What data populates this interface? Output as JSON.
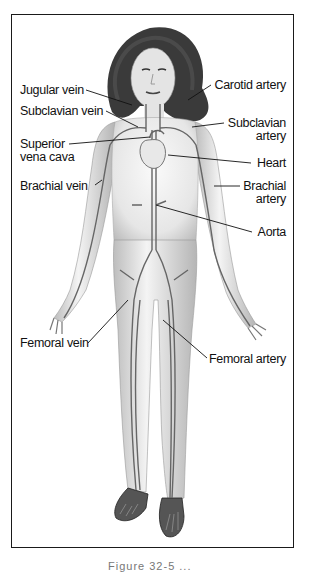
{
  "figure": {
    "labels": {
      "jugular_vein": "Jugular vein",
      "subclavian_vein": "Subclavian vein",
      "superior_vena_cava_1": "Superior",
      "superior_vena_cava_2": "vena cava",
      "brachial_vein": "Brachial vein",
      "carotid_artery": "Carotid artery",
      "subclavian_artery_1": "Subclavian",
      "subclavian_artery_2": "artery",
      "heart": "Heart",
      "brachial_artery_1": "Brachial",
      "brachial_artery_2": "artery",
      "aorta": "Aorta",
      "femoral_vein": "Femoral vein",
      "femoral_artery": "Femoral artery"
    },
    "caption": "Figure 32-5 ..."
  },
  "colors": {
    "frame": "#1a1a1a",
    "vessel": "#555555",
    "skin": "#ededed",
    "hair": "#3a3a3a",
    "text": "#111111"
  }
}
